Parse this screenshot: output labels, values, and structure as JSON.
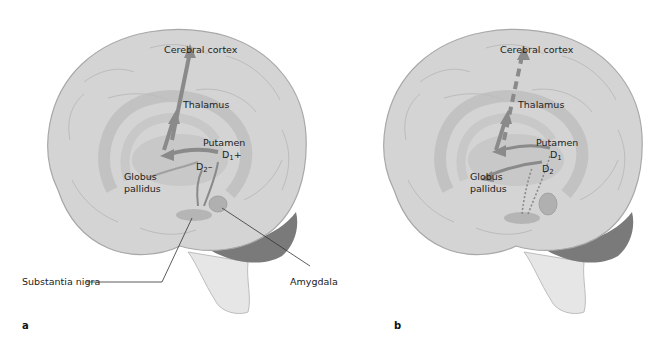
{
  "figure": {
    "panels": [
      {
        "letter": "a",
        "labels": {
          "cortex": "Cerebral cortex",
          "thalamus": "Thalamus",
          "putamen": "Putamen",
          "d1": "D",
          "d1_sub": "1",
          "d1_sign": "+",
          "d2": "D",
          "d2_sub": "2",
          "d2_sign": "–",
          "globus_line1": "Globus",
          "globus_line2": "pallidus",
          "substantia": "Substantia nigra",
          "amygdala": "Amygdala"
        },
        "pathway_style": "solid"
      },
      {
        "letter": "b",
        "labels": {
          "cortex": "Cerebral cortex",
          "thalamus": "Thalamus",
          "putamen": "Putamen",
          "d1": "D",
          "d1_sub": "1",
          "d2": "D",
          "d2_sub": "2",
          "globus_line1": "Globus",
          "globus_line2": "pallidus"
        },
        "pathway_style": "dashed"
      }
    ],
    "colors": {
      "brain_fill": "#d4d4d4",
      "brain_edge": "#a8a8a8",
      "inner_structure": "#bdbdbd",
      "arrow": "#8a8a8a",
      "cerebellum": "#7a7a7a",
      "brainstem": "#e6e6e6",
      "text": "#222222"
    }
  }
}
